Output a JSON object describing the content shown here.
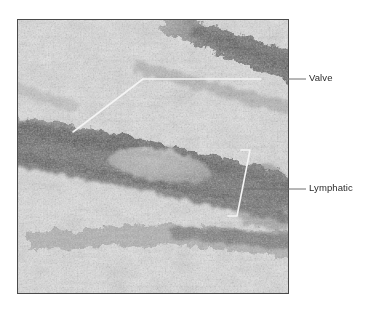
{
  "figure": {
    "type": "micrograph",
    "modality": "light micrograph of tissue section",
    "panel": {
      "x": 17,
      "y": 19,
      "width": 272,
      "height": 275,
      "border_color": "#4a4a4a"
    },
    "background_color": "#ffffff"
  },
  "annotations": [
    {
      "id": "valve",
      "label": "Valve",
      "label_x": 309,
      "label_y": 72,
      "leader_color": "#6e6e6e",
      "pointer_color": "#f2f2f2",
      "leader": {
        "x1": 306,
        "y1": 79,
        "x2": 261,
        "y2": 79
      },
      "pointer": [
        {
          "x1": 261,
          "y1": 79,
          "x2": 143,
          "y2": 79
        },
        {
          "x1": 143,
          "y1": 79,
          "x2": 73,
          "y2": 132
        }
      ]
    },
    {
      "id": "lymphatic",
      "label": "Lymphatic",
      "label_x": 309,
      "label_y": 182,
      "leader_color": "#6e6e6e",
      "pointer_color": "#f2f2f2",
      "leader": {
        "x1": 306,
        "y1": 189,
        "x2": 243,
        "y2": 189
      },
      "bracket": {
        "top": {
          "x": 248,
          "y": 150
        },
        "mid": {
          "x": 243,
          "y": 189
        },
        "bottom": {
          "x": 237,
          "y": 216
        },
        "cap_length": 7
      }
    }
  ],
  "labels": {
    "valve": "Valve",
    "lymphatic": "Lymphatic"
  },
  "tissue": {
    "description": "Granular pale stromal tissue traversed by dark diagonal bands forming a lymphatic channel; a pale lens-shaped valve leaflet lies within the lumen.",
    "palette": {
      "background_light": "#dcdcdc",
      "granule_light": "#f0f0f0",
      "granule_mid": "#a8a8a8",
      "band_dark": "#4a4a4a",
      "band_darkest": "#2e2e2e",
      "valve_lumen": "#8d8d8d"
    }
  }
}
